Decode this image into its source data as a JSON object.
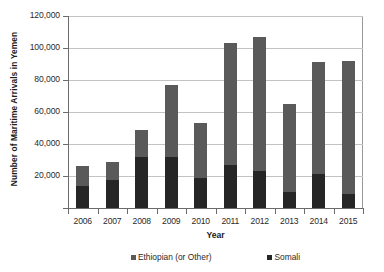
{
  "chart_data": {
    "type": "bar",
    "subtype": "stacked-bar",
    "title": "",
    "xlabel": "Year",
    "ylabel": "Number of Maritime Arrivals in Yemen",
    "categories": [
      "2006",
      "2007",
      "2008",
      "2009",
      "2010",
      "2011",
      "2012",
      "2013",
      "2014",
      "2015"
    ],
    "series": [
      {
        "name": "Somali",
        "color": "#262626",
        "values": [
          14000,
          17500,
          32000,
          32000,
          19000,
          27000,
          23000,
          10000,
          21000,
          9000
        ]
      },
      {
        "name": "Ethiopian (or Other)",
        "color": "#5a5a5a",
        "values": [
          12000,
          11500,
          17000,
          45000,
          34000,
          76000,
          84000,
          55000,
          70000,
          83000
        ]
      }
    ],
    "totals": [
      26000,
      29000,
      49000,
      77000,
      53000,
      103000,
      107000,
      65000,
      91000,
      92000
    ],
    "ylim": [
      0,
      120000
    ],
    "yticks": [
      0,
      20000,
      40000,
      60000,
      80000,
      100000,
      120000
    ],
    "ytick_labels": [
      "",
      "20,000",
      "40,000",
      "60,000",
      "80,000",
      "100,000",
      "120,000"
    ],
    "grid": true,
    "legend_position": "bottom",
    "legend_order": [
      "Ethiopian (or Other)",
      "Somali"
    ]
  },
  "axes": {
    "y_title": "Number of Maritime Arrivals in Yemen",
    "x_title": "Year"
  },
  "legend": {
    "items": [
      {
        "label": "Ethiopian (or Other)",
        "color": "#5a5a5a"
      },
      {
        "label": "Somali",
        "color": "#262626"
      }
    ]
  },
  "colors": {
    "ethiopian": "#5a5a5a",
    "somali": "#262626",
    "gridline": "#c3c3c3",
    "axis": "#6b6b6b",
    "text": "#2a2a2a",
    "background": "#ffffff"
  }
}
